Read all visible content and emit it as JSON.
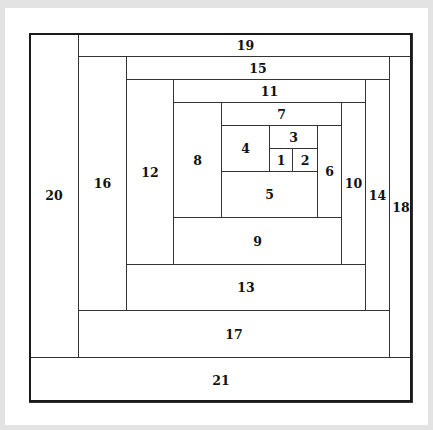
{
  "diagram": {
    "type": "fibonacci-like spiral square tiling",
    "frame": {
      "x": 29,
      "y": 33,
      "w": 383,
      "h": 369
    },
    "cells": [
      {
        "label": "1",
        "x": 269,
        "y": 148,
        "w": 23,
        "h": 23
      },
      {
        "label": "2",
        "x": 292,
        "y": 148,
        "w": 25,
        "h": 23
      },
      {
        "label": "3",
        "x": 269,
        "y": 125,
        "w": 48,
        "h": 23
      },
      {
        "label": "4",
        "x": 221,
        "y": 125,
        "w": 48,
        "h": 46
      },
      {
        "label": "5",
        "x": 221,
        "y": 171,
        "w": 96,
        "h": 46
      },
      {
        "label": "6",
        "x": 317,
        "y": 125,
        "w": 24,
        "h": 92
      },
      {
        "label": "7",
        "x": 221,
        "y": 102,
        "w": 120,
        "h": 23
      },
      {
        "label": "8",
        "x": 173,
        "y": 102,
        "w": 48,
        "h": 115
      },
      {
        "label": "9",
        "x": 173,
        "y": 217,
        "w": 168,
        "h": 47
      },
      {
        "label": "10",
        "x": 341,
        "y": 102,
        "w": 24,
        "h": 162
      },
      {
        "label": "11",
        "x": 173,
        "y": 79,
        "w": 192,
        "h": 23
      },
      {
        "label": "12",
        "x": 126,
        "y": 79,
        "w": 47,
        "h": 185
      },
      {
        "label": "13",
        "x": 126,
        "y": 264,
        "w": 239,
        "h": 46
      },
      {
        "label": "14",
        "x": 365,
        "y": 79,
        "w": 24,
        "h": 231
      },
      {
        "label": "15",
        "x": 126,
        "y": 56,
        "w": 263,
        "h": 23
      },
      {
        "label": "16",
        "x": 78,
        "y": 56,
        "w": 48,
        "h": 254
      },
      {
        "label": "17",
        "x": 78,
        "y": 310,
        "w": 311,
        "h": 47
      },
      {
        "label": "18",
        "x": 389,
        "y": 56,
        "w": 23,
        "h": 301
      },
      {
        "label": "19",
        "x": 78,
        "y": 33,
        "w": 334,
        "h": 23
      },
      {
        "label": "20",
        "x": 29,
        "y": 33,
        "w": 49,
        "h": 324
      },
      {
        "label": "21",
        "x": 29,
        "y": 357,
        "w": 383,
        "h": 45
      }
    ]
  }
}
